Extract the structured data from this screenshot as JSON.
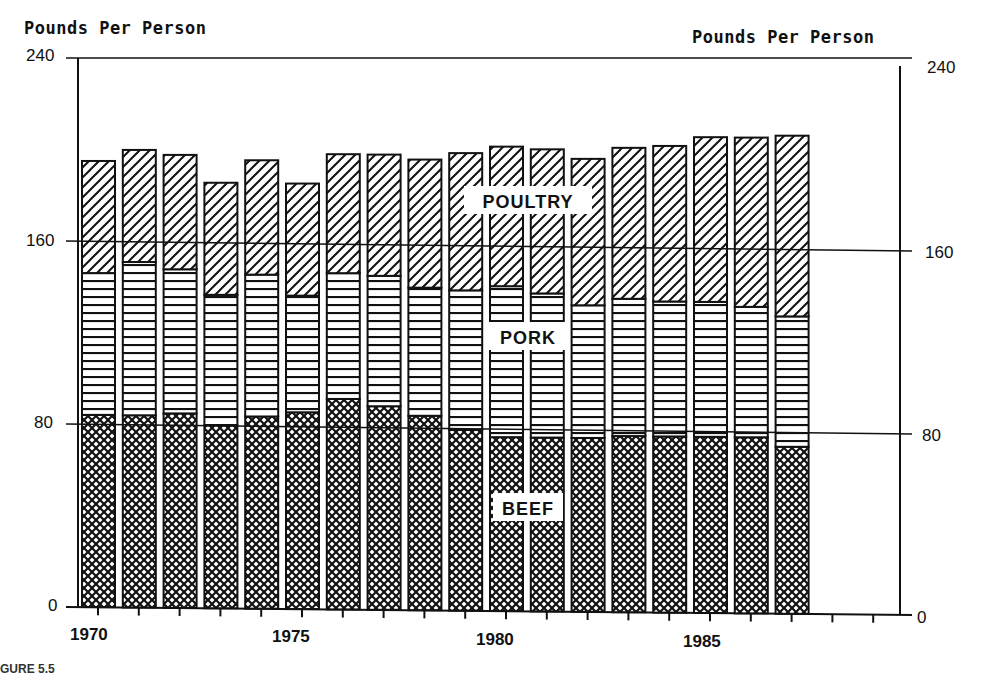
{
  "chart_data": {
    "type": "bar",
    "stacked": true,
    "title": "",
    "ylabel_left": "Pounds Per Person",
    "ylabel_right": "Pounds Per Person",
    "xlabel": "",
    "ylim": [
      0,
      240
    ],
    "yticks": [
      0,
      80,
      160,
      240
    ],
    "xtick_labels": [
      "1970",
      "1975",
      "1980",
      "1985"
    ],
    "gridlines_at": [
      80,
      160,
      240
    ],
    "categories": [
      "1970",
      "1971",
      "1972",
      "1973",
      "1974",
      "1975",
      "1976",
      "1977",
      "1978",
      "1979",
      "1980",
      "1981",
      "1982",
      "1983",
      "1984",
      "1985",
      "1986",
      "1987"
    ],
    "series": [
      {
        "name": "BEEF",
        "pattern": "crosshatch",
        "values": [
          84,
          84,
          85,
          80,
          84,
          86,
          92,
          89,
          85,
          79,
          76,
          76,
          76,
          77,
          77,
          77,
          77,
          73
        ]
      },
      {
        "name": "PORK",
        "pattern": "horizontal-lines",
        "values": [
          62,
          67,
          63,
          57,
          62,
          51,
          55,
          57,
          56,
          61,
          66,
          63,
          58,
          60,
          59,
          59,
          57,
          57
        ]
      },
      {
        "name": "POULTRY",
        "pattern": "diagonal-lines",
        "values": [
          49,
          49,
          50,
          49,
          50,
          49,
          52,
          53,
          56,
          60,
          61,
          63,
          64,
          66,
          68,
          72,
          74,
          79
        ]
      }
    ],
    "totals": [
      195,
      200,
      198,
      186,
      196,
      186,
      199,
      199,
      197,
      200,
      203,
      202,
      198,
      203,
      204,
      208,
      208,
      209
    ],
    "annotations": [
      "POULTRY",
      "PORK",
      "BEEF"
    ],
    "legend": "none (inline segment labels)",
    "grid": true
  },
  "labels": {
    "y_left_title": "Pounds Per Person",
    "y_right_title": "Pounds Per Person",
    "y_left_ticks": [
      "240",
      "160",
      "80",
      "0"
    ],
    "y_right_ticks": [
      "240",
      "160",
      "80",
      "0"
    ],
    "x_ticks": [
      "1970",
      "1975",
      "1980",
      "1985"
    ],
    "seg_poultry": "POULTRY",
    "seg_pork": "PORK",
    "seg_beef": "BEEF",
    "caption": "GURE 5.5"
  }
}
